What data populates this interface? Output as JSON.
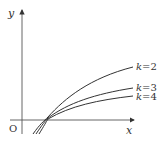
{
  "axes": {
    "x_label": "x",
    "y_label": "y",
    "origin_label": "O"
  },
  "curves": [
    {
      "k_var": "k",
      "eq": "=",
      "value": "2"
    },
    {
      "k_var": "k",
      "eq": "=",
      "value": "3"
    },
    {
      "k_var": "k",
      "eq": "=",
      "value": "4"
    }
  ],
  "colors": {
    "stroke": "#333333"
  }
}
